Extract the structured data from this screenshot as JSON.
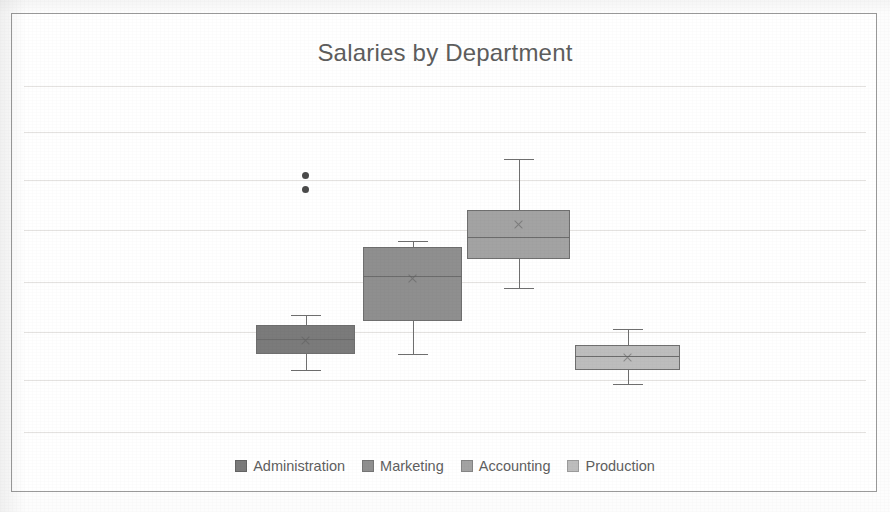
{
  "chart": {
    "title": "Salaries by Department",
    "frame": {
      "border_color": "#9a9a9a",
      "background": "#ffffff"
    },
    "title_color": "#5d5d5d"
  },
  "legend": {
    "position": "bottom",
    "items": [
      {
        "label": "Administration",
        "color": "#7b7b7b"
      },
      {
        "label": "Marketing",
        "color": "#8f8f8f"
      },
      {
        "label": "Accounting",
        "color": "#a3a3a3"
      },
      {
        "label": "Production",
        "color": "#bdbdbd"
      }
    ]
  },
  "chart_data": {
    "type": "box",
    "title": "Salaries by Department",
    "xlabel": "",
    "ylabel": "",
    "grid": true,
    "gridline_count": 8,
    "axis_tick_labels": [],
    "categories": [
      "Administration",
      "Marketing",
      "Accounting",
      "Production"
    ],
    "series": [
      {
        "name": "Administration",
        "color": "#7b7b7b",
        "whisker_low": 0.205,
        "q1": 0.245,
        "median": 0.285,
        "q3": 0.32,
        "whisker_high": 0.345,
        "mean": 0.283,
        "outliers": [
          0.705,
          0.67
        ]
      },
      {
        "name": "Marketing",
        "color": "#8f8f8f",
        "whisker_low": 0.245,
        "q1": 0.33,
        "median": 0.445,
        "q3": 0.52,
        "whisker_high": 0.535,
        "mean": 0.44,
        "outliers": []
      },
      {
        "name": "Accounting",
        "color": "#a3a3a3",
        "whisker_low": 0.415,
        "q1": 0.49,
        "median": 0.545,
        "q3": 0.615,
        "whisker_high": 0.745,
        "mean": 0.58,
        "outliers": []
      },
      {
        "name": "Production",
        "color": "#bdbdbd",
        "whisker_low": 0.17,
        "q1": 0.205,
        "median": 0.242,
        "q3": 0.27,
        "whisker_high": 0.31,
        "mean": 0.238,
        "outliers": []
      }
    ]
  },
  "geometry": {
    "plot_height": 390,
    "gridline_y": [
      26,
      72,
      120,
      170,
      222,
      272,
      320,
      372
    ],
    "series_x": [
      {
        "left": 232,
        "width": 99
      },
      {
        "left": 339,
        "width": 99
      },
      {
        "left": 443,
        "width": 103
      },
      {
        "left": 551,
        "width": 105
      }
    ]
  }
}
